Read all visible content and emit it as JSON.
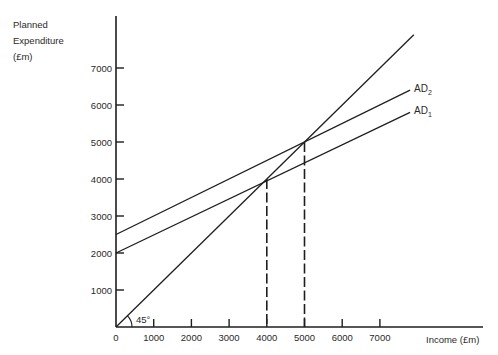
{
  "chart_data": {
    "type": "line",
    "title": "",
    "title_partially_visible": true,
    "xlabel": "Income (£m)",
    "ylabel": [
      "Planned",
      "Expenditure",
      "(£m)"
    ],
    "x_ticks": [
      "0",
      "1000",
      "2000",
      "3000",
      "4000",
      "5000",
      "6000",
      "7000"
    ],
    "y_ticks": [
      "1000",
      "2000",
      "3000",
      "4000",
      "5000",
      "6000",
      "7000"
    ],
    "xlim": [
      0,
      9000
    ],
    "ylim": [
      0,
      8000
    ],
    "grid": false,
    "series": [
      {
        "name": "45° line",
        "x": [
          0,
          7900
        ],
        "y": [
          0,
          7900
        ]
      },
      {
        "name": "AD2",
        "label": "AD",
        "subscript": "2",
        "x": [
          0,
          7800
        ],
        "y": [
          2500,
          6400
        ]
      },
      {
        "name": "AD1",
        "label": "AD",
        "subscript": "1",
        "x": [
          0,
          7800
        ],
        "y": [
          2000,
          5800
        ]
      }
    ],
    "annotations": [
      {
        "text": "45°",
        "at": [
          0,
          0
        ]
      },
      {
        "type": "dashed-vertical",
        "x": 4000,
        "y_top": 4000,
        "note": "equilibrium with AD1"
      },
      {
        "type": "dashed-vertical",
        "x": 5000,
        "y_top": 5000,
        "note": "equilibrium with AD2"
      }
    ]
  },
  "labels": {
    "angle": "45°",
    "ad2": "AD",
    "ad2_sub": "2",
    "ad1": "AD",
    "ad1_sub": "1",
    "xlabel": "Income (£m)",
    "ylabel_1": "Planned",
    "ylabel_2": "Expenditure",
    "ylabel_3": "(£m)"
  }
}
